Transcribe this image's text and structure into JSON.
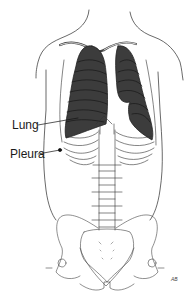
{
  "diagram": {
    "labels": [
      {
        "id": "lung",
        "text": "Lung"
      },
      {
        "id": "pleura",
        "text": "Pleura"
      }
    ],
    "signature": "AB",
    "colors": {
      "line": "#2a2a2a",
      "lung_fill": "#3c3c3c",
      "background": "#ffffff"
    }
  }
}
